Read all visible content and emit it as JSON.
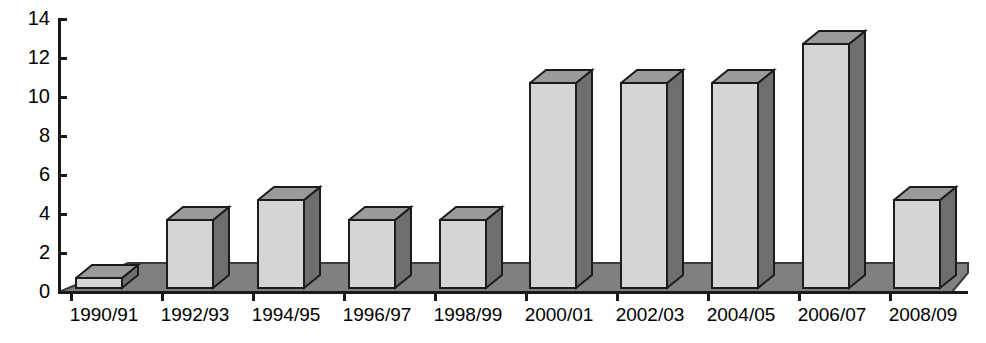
{
  "chart_data": {
    "type": "bar",
    "title": "",
    "subtitle": "",
    "xlabel": "",
    "ylabel": "",
    "categories": [
      "1990/91",
      "1992/93",
      "1994/95",
      "1996/97",
      "1998/99",
      "2000/01",
      "2002/03",
      "2004/05",
      "2006/07",
      "2008/09"
    ],
    "values": [
      1,
      4,
      5,
      4,
      4,
      11,
      11,
      11,
      13,
      5
    ],
    "ylim": [
      0,
      14
    ],
    "y_ticks": [
      0,
      2,
      4,
      6,
      8,
      10,
      12,
      14
    ],
    "y_tick_labels": [
      "0",
      "2",
      "4",
      "6",
      "8",
      "10",
      "12",
      "14"
    ],
    "grid": false,
    "legend": false,
    "legend_position": "none",
    "style": "3d-bar",
    "colors": {
      "bar_front": "#d5d5d5",
      "bar_top": "#9a9a9a",
      "bar_side": "#6e6e6e",
      "floor": "#808080",
      "floor_edge": "#3a3a3a",
      "axis": "#1a1a1a",
      "background": "#ffffff",
      "text": "#000000"
    }
  },
  "axes": {
    "y_axis_name": "value-axis",
    "x_axis_name": "category-axis"
  }
}
